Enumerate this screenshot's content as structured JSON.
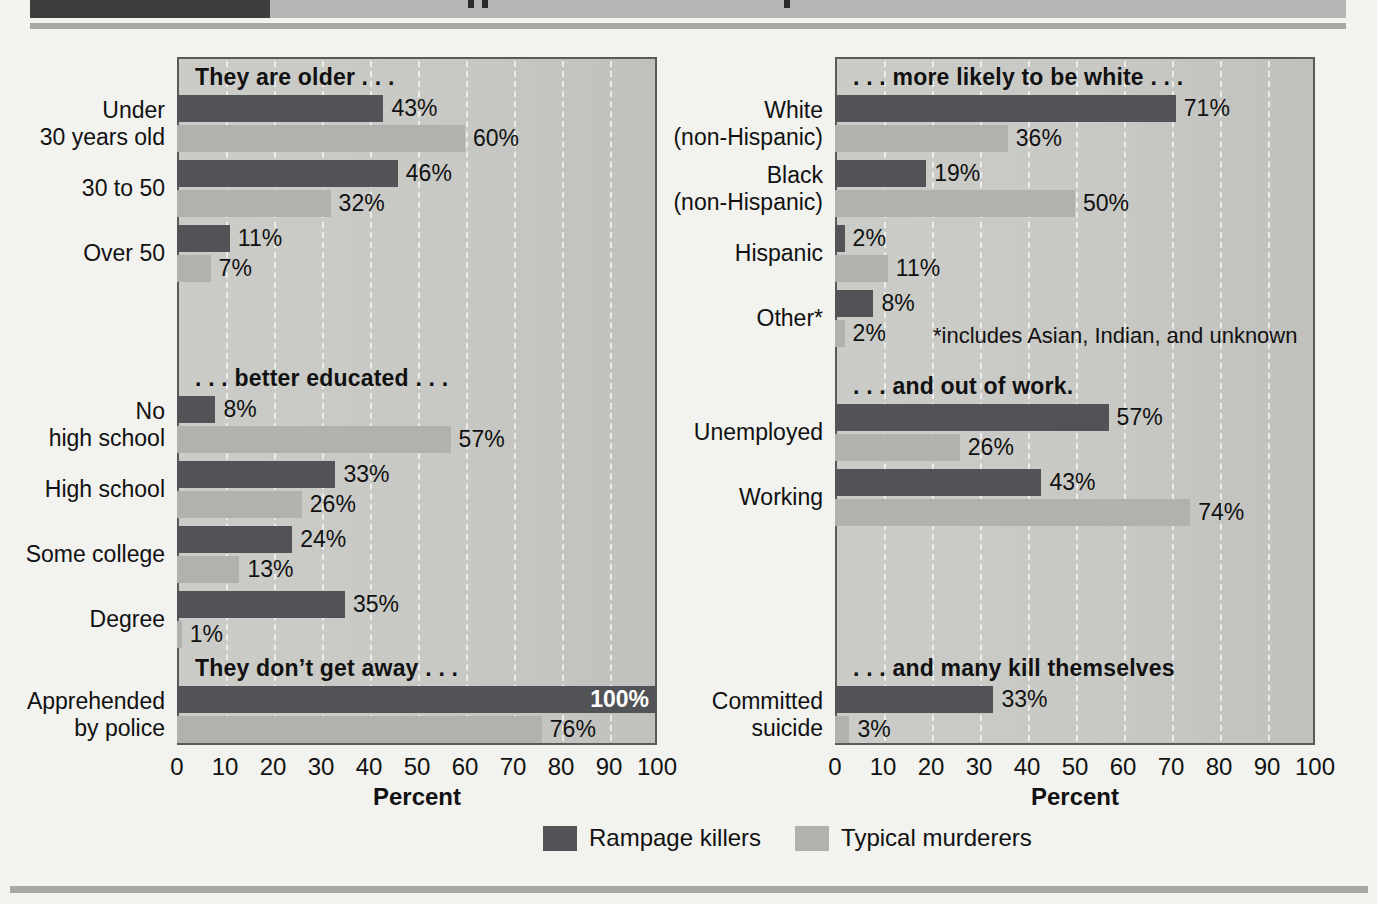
{
  "colors": {
    "rampage": "#525356",
    "typical": "#b1b2ae",
    "plot_bg": "#c8c9c5",
    "grid": "#f0f0ee",
    "header_dark": "#3d3d3d",
    "header_gray": "#b5b5b3"
  },
  "legend": {
    "items": [
      {
        "label": "Rampage killers",
        "color": "#525356"
      },
      {
        "label": "Typical murderers",
        "color": "#b1b2ae"
      }
    ]
  },
  "chart_data": [
    {
      "type": "bar",
      "orientation": "horizontal",
      "xlabel": "Percent",
      "xlim": [
        0,
        100
      ],
      "ticks": [
        0,
        10,
        20,
        30,
        40,
        50,
        60,
        70,
        80,
        90,
        100
      ],
      "grid": "white-dashed-vertical",
      "series_names": [
        "Rampage killers",
        "Typical murderers"
      ],
      "sections": [
        {
          "heading": "They are older . . .",
          "gap_before": 0,
          "rows": [
            {
              "label": [
                "Under",
                "30 years old"
              ],
              "rampage": 43,
              "typical": 60
            },
            {
              "label": [
                "30 to 50"
              ],
              "rampage": 46,
              "typical": 32
            },
            {
              "label": [
                "Over 50"
              ],
              "rampage": 11,
              "typical": 7
            }
          ]
        },
        {
          "heading": ". . . better educated . . .",
          "gap_before": 82,
          "rows": [
            {
              "label": [
                "No",
                "high school"
              ],
              "rampage": 8,
              "typical": 57
            },
            {
              "label": [
                "High school"
              ],
              "rampage": 33,
              "typical": 26
            },
            {
              "label": [
                "Some college"
              ],
              "rampage": 24,
              "typical": 13
            },
            {
              "label": [
                "Degree"
              ],
              "rampage": 35,
              "typical": 1
            }
          ]
        },
        {
          "heading": "They don’t get away . . .",
          "gap_before": 6,
          "rows": [
            {
              "label": [
                "Apprehended",
                "by police"
              ],
              "rampage": 100,
              "typical": 76,
              "rampage_label_inside": true
            }
          ]
        }
      ]
    },
    {
      "type": "bar",
      "orientation": "horizontal",
      "xlabel": "Percent",
      "xlim": [
        0,
        100
      ],
      "ticks": [
        0,
        10,
        20,
        30,
        40,
        50,
        60,
        70,
        80,
        90,
        100
      ],
      "grid": "white-dashed-vertical",
      "series_names": [
        "Rampage killers",
        "Typical murderers"
      ],
      "sections": [
        {
          "heading": ". . . more likely to be white . . .",
          "gap_before": 0,
          "rows": [
            {
              "label": [
                "White",
                "(non-Hispanic)"
              ],
              "rampage": 71,
              "typical": 36
            },
            {
              "label": [
                "Black",
                "(non-Hispanic)"
              ],
              "rampage": 19,
              "typical": 50
            },
            {
              "label": [
                "Hispanic"
              ],
              "rampage": 2,
              "typical": 11
            },
            {
              "label": [
                "Other*"
              ],
              "rampage": 8,
              "typical": 2,
              "note": "*includes Asian, Indian, and unknown"
            }
          ]
        },
        {
          "heading": ". . . and out of work.",
          "gap_before": 25,
          "rows": [
            {
              "label": [
                "Unemployed"
              ],
              "rampage": 57,
              "typical": 26
            },
            {
              "label": [
                "Working"
              ],
              "rampage": 43,
              "typical": 74
            }
          ]
        },
        {
          "heading": ". . . and many kill themselves",
          "gap_before": 128,
          "rows": [
            {
              "label": [
                "Committed",
                "suicide"
              ],
              "rampage": 33,
              "typical": 3
            }
          ]
        }
      ]
    }
  ]
}
